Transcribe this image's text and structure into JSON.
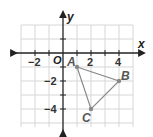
{
  "diagram": {
    "type": "coordinate-plane",
    "axes": {
      "x_label": "x",
      "y_label": "y",
      "origin_label": "O"
    },
    "x_ticks": [
      {
        "value": -2,
        "label": "−2"
      },
      {
        "value": 2,
        "label": "2"
      },
      {
        "value": 4,
        "label": "4"
      }
    ],
    "y_ticks": [
      {
        "value": -2,
        "label": "−2"
      },
      {
        "value": -4,
        "label": "−4"
      }
    ],
    "grid": {
      "x_min": -3,
      "x_max": 5,
      "y_min": -5,
      "y_max": 3
    },
    "triangle": {
      "vertices": [
        {
          "label": "A",
          "x": 1,
          "y": -1
        },
        {
          "label": "B",
          "x": 4,
          "y": -2
        },
        {
          "label": "C",
          "x": 2,
          "y": -4
        }
      ],
      "color": "#888888"
    }
  }
}
